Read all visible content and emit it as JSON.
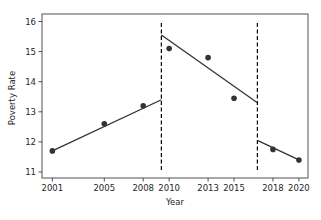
{
  "chart_data": {
    "type": "line",
    "subtype": "regression-discontinuity",
    "title": "",
    "xlabel": "Year",
    "ylabel": "Poverty Rate",
    "xlim": [
      2000.2,
      2020.7
    ],
    "ylim": [
      10.8,
      16.25
    ],
    "x_ticks": [
      2001,
      2005,
      2008,
      2010,
      2013,
      2015,
      2018,
      2020
    ],
    "y_ticks": [
      11,
      12,
      13,
      14,
      15,
      16
    ],
    "grid": false,
    "legend": null,
    "points": [
      {
        "x": 2001,
        "y": 11.7
      },
      {
        "x": 2005,
        "y": 12.6
      },
      {
        "x": 2008,
        "y": 13.2
      },
      {
        "x": 2010,
        "y": 15.1
      },
      {
        "x": 2013,
        "y": 14.8
      },
      {
        "x": 2015,
        "y": 13.45
      },
      {
        "x": 2018,
        "y": 11.75
      },
      {
        "x": 2020,
        "y": 11.4
      }
    ],
    "fit_segments": [
      {
        "x0": 2001,
        "y0": 11.7,
        "x1": 2009.4,
        "y1": 13.4
      },
      {
        "x0": 2009.4,
        "y0": 15.55,
        "x1": 2016.8,
        "y1": 13.3
      },
      {
        "x0": 2016.8,
        "y0": 12.05,
        "x1": 2020,
        "y1": 11.4
      }
    ],
    "breakpoints": [
      2009.4,
      2016.8
    ],
    "colors": {
      "points": "#333333",
      "lines": "#333333",
      "breakpoints": "#000000",
      "axes": "#262626"
    }
  }
}
